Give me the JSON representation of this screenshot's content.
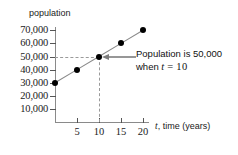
{
  "figure": {
    "background_color": "#ffffff",
    "axis_color": "#8a8a8a",
    "point_color": "#000000",
    "guide_color": "#9a9a9a"
  },
  "chart_data": {
    "type": "line",
    "title": "",
    "xlabel": "t, time (years)",
    "ylabel": "population",
    "x": [
      0,
      5,
      10,
      15,
      20
    ],
    "values": [
      30000,
      40000,
      50000,
      60000,
      70000
    ],
    "series": [
      {
        "name": "population",
        "values": [
          30000,
          40000,
          50000,
          60000,
          70000
        ]
      }
    ],
    "xlim": [
      0,
      22
    ],
    "ylim": [
      0,
      75000
    ],
    "xticks": [
      5,
      10,
      15,
      20
    ],
    "xtick_labels": [
      "5",
      "10",
      "15",
      "20"
    ],
    "yticks": [
      10000,
      20000,
      30000,
      40000,
      50000,
      60000,
      70000
    ],
    "ytick_labels": [
      "10,000",
      "20,000",
      "30,000",
      "40,000",
      "50,000",
      "60,000",
      "70,000"
    ],
    "grid": false,
    "legend": "none",
    "markers": "filled-circle",
    "annotations": [
      {
        "text_line1": "Population  is  50,000",
        "text_line2_prefix": "when ",
        "text_line2_var": "t",
        "text_line2_eq": " = ",
        "text_line2_value": "10",
        "points_to_x": 10,
        "points_to_y": 50000,
        "arrow": "left"
      }
    ],
    "guides": [
      {
        "orientation": "horizontal",
        "at_y": 50000,
        "from_x": 0,
        "to_x": 10,
        "style": "dashed"
      },
      {
        "orientation": "vertical",
        "at_x": 10,
        "from_y": 0,
        "to_y": 50000,
        "style": "dashed"
      }
    ]
  },
  "axis_titles": {
    "y": "population",
    "x_var": "t",
    "x_rest": ", time (years)"
  }
}
